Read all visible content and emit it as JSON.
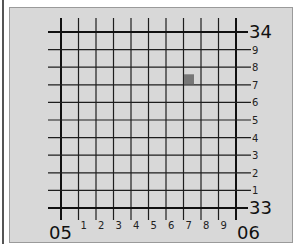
{
  "diagram": {
    "type": "grid-reference",
    "grid": {
      "divisions": 10,
      "origin_px": {
        "x": 61,
        "y": 208
      },
      "cell_px": {
        "w": 17.5,
        "h": 17.6
      }
    },
    "easting_labels": {
      "major_left": "05",
      "major_right": "06",
      "minor": [
        "1",
        "2",
        "3",
        "4",
        "5",
        "6",
        "7",
        "8",
        "9"
      ]
    },
    "northing_labels": {
      "major_bottom": "33",
      "major_top": "34",
      "minor": [
        "1",
        "2",
        "3",
        "4",
        "5",
        "6",
        "7",
        "8",
        "9"
      ]
    },
    "highlight": {
      "description": "highlighted square",
      "easting_index": 7,
      "northing_index": 7,
      "color": "#777777"
    },
    "colors": {
      "panel_background": "#d8d8d8",
      "grid_line": "#1e1e1e",
      "major_line": "#111111"
    }
  }
}
